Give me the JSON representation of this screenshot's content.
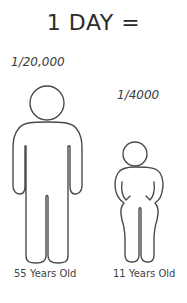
{
  "title": "1 DAY =",
  "figures": [
    {
      "id": "adult",
      "fraction_label": "1/20,000",
      "age_label": "55 Years Old"
    },
    {
      "id": "child",
      "fraction_label": "1/4000",
      "age_label": "11 Years Old"
    }
  ],
  "colors": {
    "background": "#ffffff",
    "stroke": "#4a4a4a",
    "text": "#333333"
  }
}
